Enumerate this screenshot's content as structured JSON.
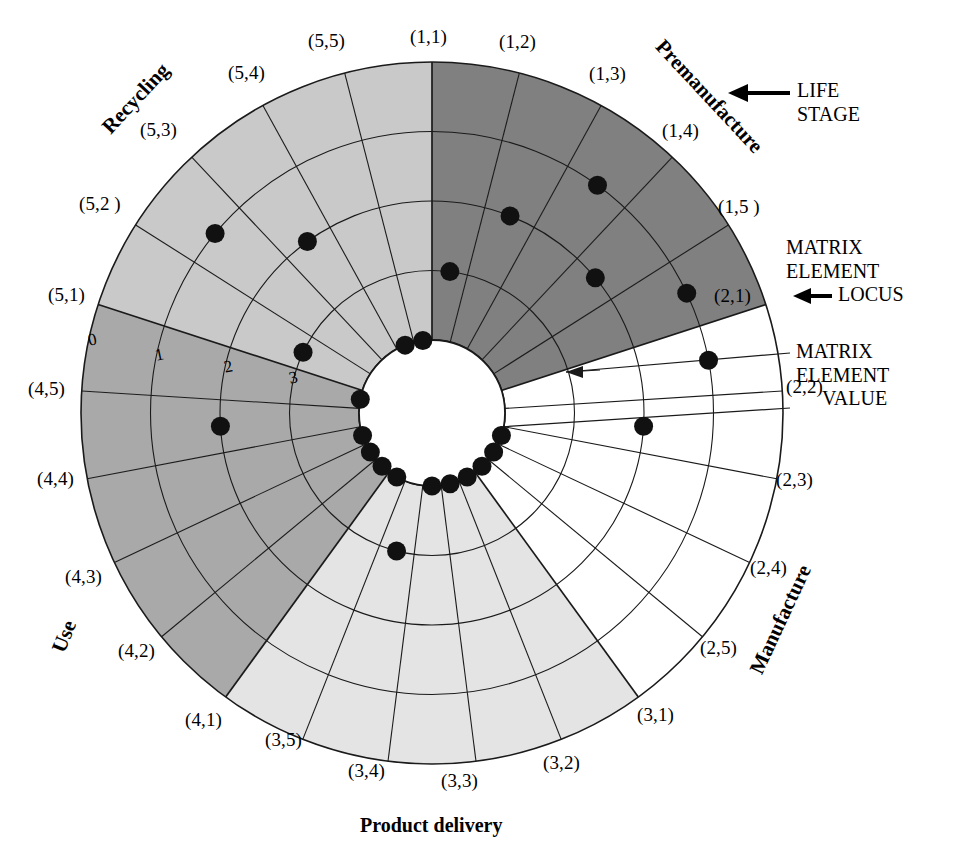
{
  "figure": {
    "caption": "Product delivery",
    "kind": "target-plot"
  },
  "annotations": {
    "life_stage": {
      "line1": "LIFE",
      "line2": "STAGE",
      "arrow": "left-arrow-icon"
    },
    "matrix_element_locus": {
      "line1": "MATRIX",
      "line2": "ELEMENT",
      "line3": "LOCUS",
      "arrow": "left-arrow-icon"
    },
    "matrix_element_value": {
      "line1": "MATRIX",
      "line2": "ELEMENT",
      "line3": "VALUE",
      "leader": "leader-line"
    }
  },
  "stage_labels": [
    {
      "name": "Premanufacture",
      "text": "Premanufacture"
    },
    {
      "name": "Manufacture",
      "text": "Manufacture"
    },
    {
      "name": "Product delivery",
      "text": "Product delivery"
    },
    {
      "name": "Use",
      "text": "Use"
    },
    {
      "name": "Recycling",
      "text": "Recycling"
    }
  ],
  "scale_ticks": [
    "0",
    "1",
    "2",
    "3"
  ],
  "chart_data": {
    "type": "radar",
    "subtitle": "",
    "xlabel": "Matrix element locus",
    "ylabel": "Matrix element value",
    "axis_note": "Radial scale runs inward: 0 at the outer rim, 4 at the inner hub",
    "radial_ticks": [
      0,
      1,
      2,
      3,
      4
    ],
    "radial_direction": "inward",
    "rlim": [
      0,
      4
    ],
    "grid": true,
    "legend": "none",
    "sectors_per_stage": 5,
    "life_stages": [
      {
        "index": 1,
        "label": "Premanufacture",
        "fill": "#808080"
      },
      {
        "index": 2,
        "label": "Manufacture",
        "fill": "#ffffff"
      },
      {
        "index": 3,
        "label": "Product delivery",
        "fill": "#e4e4e4"
      },
      {
        "index": 4,
        "label": "Use",
        "fill": "#a9a9a9"
      },
      {
        "index": 5,
        "label": "Recycling",
        "fill": "#c9c9c9"
      }
    ],
    "categories": [
      "(1,1)",
      "(1,2)",
      "(1,3)",
      "(1,4)",
      "(1,5 )",
      "(2,1)",
      "(2,2)",
      "(2,3)",
      "(2,4)",
      "(2,5)",
      "(3,1)",
      "(3,2)",
      "(3,3)",
      "(3,4)",
      "(3,5)",
      "(4,1)",
      "(4,2)",
      "(4,3)",
      "(4,4)",
      "(4,5)",
      "(5,1)",
      "(5,2)",
      "(5,3)",
      "(5,4)",
      "(5,5)"
    ],
    "values": [
      3,
      2,
      1,
      2,
      1,
      1,
      2,
      4,
      4,
      4,
      4,
      4,
      4,
      3,
      4,
      4,
      4,
      4,
      2,
      4,
      3,
      1,
      2,
      4,
      4
    ],
    "points": [
      {
        "locus": "(1,1)",
        "stage": 1,
        "element": 1,
        "value": 3
      },
      {
        "locus": "(1,2)",
        "stage": 1,
        "element": 2,
        "value": 2
      },
      {
        "locus": "(1,3)",
        "stage": 1,
        "element": 3,
        "value": 1
      },
      {
        "locus": "(1,4)",
        "stage": 1,
        "element": 4,
        "value": 2
      },
      {
        "locus": "(1,5 )",
        "stage": 1,
        "element": 5,
        "value": 1
      },
      {
        "locus": "(2,1)",
        "stage": 2,
        "element": 1,
        "value": 1
      },
      {
        "locus": "(2,2)",
        "stage": 2,
        "element": 2,
        "value": 2
      },
      {
        "locus": "(2,3)",
        "stage": 2,
        "element": 3,
        "value": 4
      },
      {
        "locus": "(2,4)",
        "stage": 2,
        "element": 4,
        "value": 4
      },
      {
        "locus": "(2,5)",
        "stage": 2,
        "element": 5,
        "value": 4
      },
      {
        "locus": "(3,1)",
        "stage": 3,
        "element": 1,
        "value": 4
      },
      {
        "locus": "(3,2)",
        "stage": 3,
        "element": 2,
        "value": 4
      },
      {
        "locus": "(3,3)",
        "stage": 3,
        "element": 3,
        "value": 4
      },
      {
        "locus": "(3,4)",
        "stage": 3,
        "element": 4,
        "value": 3
      },
      {
        "locus": "(3,5)",
        "stage": 3,
        "element": 5,
        "value": 4
      },
      {
        "locus": "(4,1)",
        "stage": 4,
        "element": 1,
        "value": 4
      },
      {
        "locus": "(4,2)",
        "stage": 4,
        "element": 2,
        "value": 4
      },
      {
        "locus": "(4,3)",
        "stage": 4,
        "element": 3,
        "value": 4
      },
      {
        "locus": "(4,4)",
        "stage": 4,
        "element": 4,
        "value": 2
      },
      {
        "locus": "(4,5)",
        "stage": 4,
        "element": 5,
        "value": 4
      },
      {
        "locus": "(5,1)",
        "stage": 5,
        "element": 1,
        "value": 3
      },
      {
        "locus": "(5,2 )",
        "stage": 5,
        "element": 2,
        "value": 1
      },
      {
        "locus": "(5,3)",
        "stage": 5,
        "element": 3,
        "value": 2
      },
      {
        "locus": "(5,4)",
        "stage": 5,
        "element": 4,
        "value": 4
      },
      {
        "locus": "(5,5)",
        "stage": 5,
        "element": 5,
        "value": 4
      }
    ]
  },
  "geometry": {
    "cx": 432,
    "cy": 413,
    "r_outer": 351,
    "r_inner": 73,
    "rings": 4,
    "sectors": 25,
    "start_angle_deg": -90
  },
  "colors": {
    "stroke": "#1a1a1a",
    "point": "#111111",
    "premanufacture": "#808080",
    "manufacture": "#ffffff",
    "product_delivery": "#e4e4e4",
    "use": "#a9a9a9",
    "recycling": "#c9c9c9",
    "background": "#ffffff"
  },
  "sector_label_text": {
    "s1_1": "(1,1)",
    "s1_2": "(1,2)",
    "s1_3": "(1,3)",
    "s1_4": "(1,4)",
    "s1_5": "(1,5 )",
    "s2_1": "(2,1)",
    "s2_2": "(2,2)",
    "s2_3": "(2,3)",
    "s2_4": "(2,4)",
    "s2_5": "(2,5)",
    "s3_1": "(3,1)",
    "s3_2": "(3,2)",
    "s3_3": "(3,3)",
    "s3_4": "(3,4)",
    "s3_5": "(3,5)",
    "s4_1": "(4,1)",
    "s4_2": "(4,2)",
    "s4_3": "(4,3)",
    "s4_4": "(4,4)",
    "s4_5": "(4,5)",
    "s5_1": "(5,1)",
    "s5_2": "(5,2 )",
    "s5_3": "(5,3)",
    "s5_4": "(5,4)",
    "s5_5": "(5,5)"
  }
}
